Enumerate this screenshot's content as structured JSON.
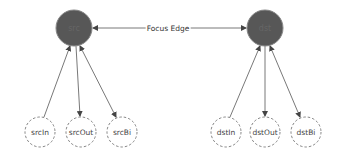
{
  "diagram": {
    "colors": {
      "focus_node_fill": "#575757",
      "focus_node_text": "#6e6e6e",
      "peripheral_stroke": "#666666",
      "edge": "#555555"
    },
    "focus_edge": {
      "label": "Focus Edge",
      "from": "src",
      "to": "dst",
      "direction": "both"
    },
    "nodes": {
      "src": {
        "label": "src",
        "x": 74,
        "y": 28,
        "r": 18
      },
      "dst": {
        "label": "dst",
        "x": 265,
        "y": 28,
        "r": 18
      },
      "srcIn": {
        "label": "srcIn",
        "x": 40,
        "y": 132,
        "r": 15
      },
      "srcOut": {
        "label": "srcOut",
        "x": 81,
        "y": 132,
        "r": 15
      },
      "srcBi": {
        "label": "srcBi",
        "x": 122,
        "y": 132,
        "r": 15
      },
      "dstIn": {
        "label": "dstIn",
        "x": 226,
        "y": 132,
        "r": 15
      },
      "dstOut": {
        "label": "dstOut",
        "x": 265,
        "y": 132,
        "r": 15
      },
      "dstBi": {
        "label": "dstBi",
        "x": 306,
        "y": 132,
        "r": 15
      }
    },
    "edges": [
      {
        "from": "srcIn",
        "to": "src",
        "direction": "in"
      },
      {
        "from": "src",
        "to": "srcOut",
        "direction": "out"
      },
      {
        "from": "src",
        "to": "srcBi",
        "direction": "both"
      },
      {
        "from": "dstIn",
        "to": "dst",
        "direction": "in"
      },
      {
        "from": "dst",
        "to": "dstOut",
        "direction": "out"
      },
      {
        "from": "dst",
        "to": "dstBi",
        "direction": "both"
      }
    ]
  }
}
